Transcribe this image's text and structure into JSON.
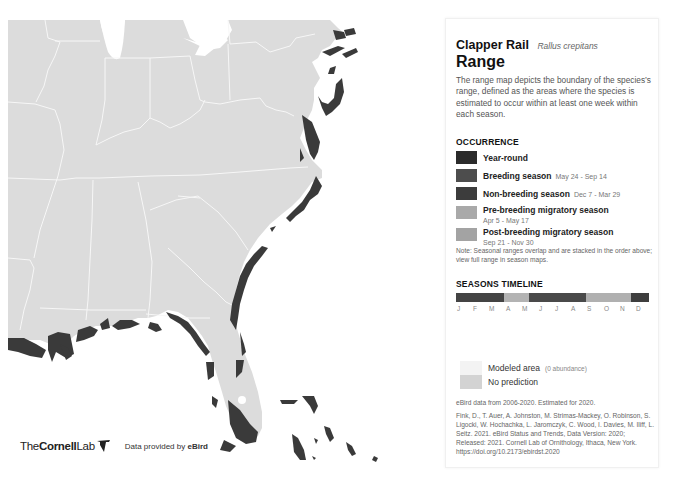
{
  "map": {
    "colors": {
      "land": "#dcdcdc",
      "borders": "#f7f7f7",
      "water": "#ffffff",
      "range_dark": "#3a3a3a"
    },
    "region": "Eastern United States"
  },
  "credits": {
    "logo_the": "The",
    "logo_cornell": "Cornell",
    "logo_lab": "Lab",
    "provided_prefix": "Data provided by ",
    "provided_brand": "eBird"
  },
  "panel": {
    "common_name": "Clapper Rail",
    "scientific_name": "Rallus crepitans",
    "section_title": "Range",
    "description": "The range map depicts the boundary of the species’s range, defined as the areas where the species is estimated to occur within at least one week within each season.",
    "occurrence_heading": "OCCURRENCE",
    "legend": [
      {
        "label": "Year-round",
        "dates": "",
        "color": "#2b2b2b"
      },
      {
        "label": "Breeding season",
        "dates": "May 24 - Sep 14",
        "color": "#4d4d4d"
      },
      {
        "label": "Non-breeding season",
        "dates": "Dec 7 - Mar 29",
        "color": "#3c3c3c"
      },
      {
        "label": "Pre-breeding migratory season",
        "dates": "Apr 5 - May 17",
        "color": "#a9a9a9"
      },
      {
        "label": "Post-breeding migratory season",
        "dates": "Sep 21 - Nov 30",
        "color": "#a3a3a3"
      }
    ],
    "note": "Note: Seasonal ranges overlap and are stacked in the order above; view full range in season maps.",
    "seasons_heading": "SEASONS TIMELINE",
    "timeline": [
      {
        "season": "non-breeding",
        "color": "#444444",
        "width_pct": 25
      },
      {
        "season": "pre-breeding",
        "color": "#b3b3b3",
        "width_pct": 13
      },
      {
        "season": "breeding",
        "color": "#4a4a4a",
        "width_pct": 29.5
      },
      {
        "season": "post-breeding",
        "color": "#b0b0b0",
        "width_pct": 23
      },
      {
        "season": "non-breeding",
        "color": "#3e3e3e",
        "width_pct": 9.5
      }
    ],
    "months": [
      "J",
      "F",
      "M",
      "A",
      "M",
      "J",
      "J",
      "A",
      "S",
      "O",
      "N",
      "D"
    ],
    "modeled_area_label": "Modeled area",
    "modeled_area_sub": "(0 abundance)",
    "modeled_area_color": "#f3f3f3",
    "no_prediction_label": "No prediction",
    "no_prediction_color": "#d3d3d3",
    "ebird_data": "eBird data from 2006-2020. Estimated for 2020.",
    "citation": "Fink, D., T. Auer, A. Johnston, M. Strimas-Mackey, O. Robinson, S. Ligocki, W. Hochachka, L. Jaromczyk, C. Wood, I. Davies, M. Iliff, L. Seitz. 2021. eBird Status and Trends, Data Version: 2020; Released: 2021. Cornell Lab of Ornithology, Ithaca, New York. https://doi.org/10.2173/ebirdst.2020"
  }
}
